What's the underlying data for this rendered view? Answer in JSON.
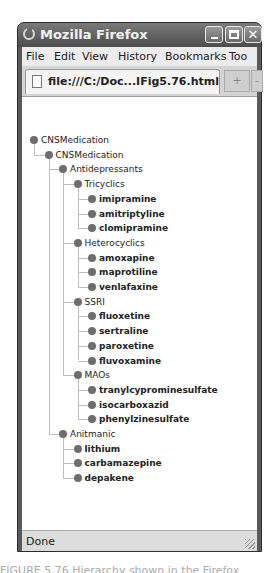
{
  "window": {
    "title": "Mozilla Firefox",
    "buttons": {
      "minimize": "_",
      "maximize": "□",
      "close": "✕"
    }
  },
  "menubar": {
    "items": [
      {
        "label": "File",
        "accel": "F"
      },
      {
        "label": "Edit",
        "accel": "E"
      },
      {
        "label": "View",
        "accel": "V"
      },
      {
        "label": "History",
        "accel": "s"
      },
      {
        "label": "Bookmarks",
        "accel": "B"
      },
      {
        "label": "Too",
        "accel": "T"
      }
    ]
  },
  "tabbar": {
    "tab_label": "file:///C:/Doc...IFig5.76.html",
    "new_tab": "+",
    "more": "-"
  },
  "tree": {
    "nodes": [
      {
        "label": "CNSMedication",
        "level": 0
      },
      {
        "label": "CNSMedication",
        "level": 1
      },
      {
        "label": "Antidepressants",
        "level": 2
      },
      {
        "label": "Tricyclics",
        "level": 3
      },
      {
        "label": "imipramine",
        "level": 4
      },
      {
        "label": "amitriptyline",
        "level": 4
      },
      {
        "label": "clomipramine",
        "level": 4
      },
      {
        "label": "Heterocyclics",
        "level": 3
      },
      {
        "label": "amoxapine",
        "level": 4
      },
      {
        "label": "maprotiline",
        "level": 4
      },
      {
        "label": "venlafaxine",
        "level": 4
      },
      {
        "label": "SSRI",
        "level": 3
      },
      {
        "label": "fluoxetine",
        "level": 4
      },
      {
        "label": "sertraline",
        "level": 4
      },
      {
        "label": "paroxetine",
        "level": 4
      },
      {
        "label": "fluvoxamine",
        "level": 4
      },
      {
        "label": "MAOs",
        "level": 3
      },
      {
        "label": "tranylcyprominesulfate",
        "level": 4
      },
      {
        "label": "isocarboxazid",
        "level": 4
      },
      {
        "label": "phenylzinesulfate",
        "level": 4
      },
      {
        "label": "Anitmanic",
        "level": 2
      },
      {
        "label": "lithium",
        "level": 3
      },
      {
        "label": "carbamazepine",
        "level": 3
      },
      {
        "label": "depakene",
        "level": 3
      }
    ]
  },
  "statusbar": {
    "text": "Done"
  },
  "caption": {
    "text": "FIGURE 5.76 Hierarchy shown in the Firefox"
  }
}
